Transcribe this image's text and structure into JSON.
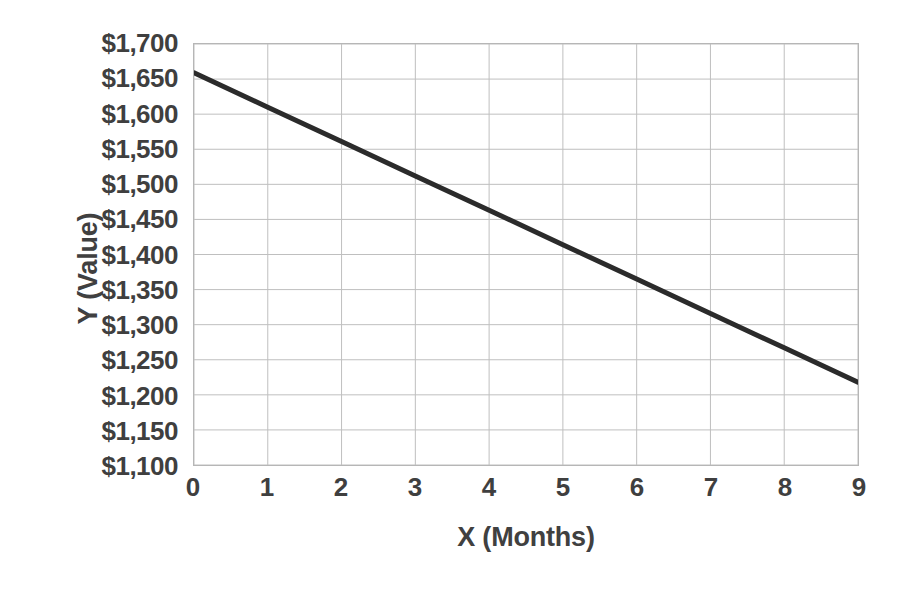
{
  "chart_data": {
    "type": "line",
    "title": "",
    "subtitle": "",
    "xlabel": "X (Months)",
    "ylabel": "Y (Value)",
    "x": [
      0,
      1,
      2,
      3,
      4,
      5,
      6,
      7,
      8,
      9
    ],
    "series": [
      {
        "name": "Value",
        "color": "#2b2b2b",
        "values": [
          1659,
          1610,
          1561,
          1512,
          1463,
          1414,
          1365,
          1316,
          1267,
          1218
        ]
      }
    ],
    "xlim": [
      0,
      9
    ],
    "ylim": [
      1100,
      1700
    ],
    "x_tick_labels": [
      "0",
      "1",
      "2",
      "3",
      "4",
      "5",
      "6",
      "7",
      "8",
      "9"
    ],
    "y_tick_values": [
      1700,
      1650,
      1600,
      1550,
      1500,
      1450,
      1400,
      1350,
      1300,
      1250,
      1200,
      1150,
      1100
    ],
    "y_tick_labels": [
      "$1,700",
      "$1,650",
      "$1,600",
      "$1,550",
      "$1,500",
      "$1,450",
      "$1,400",
      "$1,350",
      "$1,300",
      "$1,250",
      "$1,200",
      "$1,150",
      "$1,100"
    ],
    "grid": {
      "horizontal": true,
      "vertical": true,
      "color": "#bfbfbf"
    },
    "legend": {
      "visible": false,
      "position": "none"
    },
    "line_width": 5,
    "markers": false,
    "plot_border_color": "#b6b6b6",
    "background_color": "#ffffff",
    "text_color": "#3f3f3f"
  }
}
